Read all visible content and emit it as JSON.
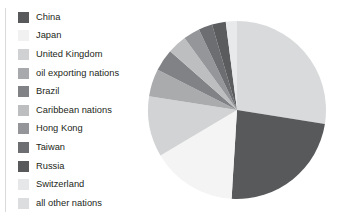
{
  "chart_data": {
    "type": "pie",
    "title": "",
    "legend_position": "left",
    "grid": false,
    "categories": [
      "China",
      "Japan",
      "United Kingdom",
      "oil exporting nations",
      "Brazil",
      "Caribbean nations",
      "Hong Kong",
      "Taiwan",
      "Russia",
      "Switzerland",
      "all other nations"
    ],
    "values": [
      23.5,
      15.5,
      11.0,
      5.0,
      4.0,
      3.5,
      3.0,
      2.5,
      2.5,
      2.0,
      27.5
    ],
    "colors": [
      "#58595b",
      "#f4f4f4",
      "#d2d3d4",
      "#a9abad",
      "#808285",
      "#bcbec0",
      "#949699",
      "#6d6e71",
      "#5b5c5e",
      "#e8e9ea",
      "#d9dadb"
    ]
  },
  "legend": {
    "items": [
      {
        "label": "China",
        "color": "#58595b"
      },
      {
        "label": "Japan",
        "color": "#f1f1f1"
      },
      {
        "label": "United Kingdom",
        "color": "#d0d1d2"
      },
      {
        "label": "oil exporting nations",
        "color": "#a7a9ac"
      },
      {
        "label": "Brazil",
        "color": "#808285"
      },
      {
        "label": "Caribbean nations",
        "color": "#bcbec0"
      },
      {
        "label": "Hong Kong",
        "color": "#939598"
      },
      {
        "label": "Taiwan",
        "color": "#6d6e71"
      },
      {
        "label": "Russia",
        "color": "#58595b"
      },
      {
        "label": "Switzerland",
        "color": "#e6e7e8"
      },
      {
        "label": "all other nations",
        "color": "#dcdddf"
      }
    ]
  },
  "pie": {
    "center_x": 97,
    "center_y": 98,
    "radius": 89,
    "start_angle": 0,
    "slices": [
      {
        "name": "all other nations",
        "sweep": 99.0,
        "color": "#d9dadb"
      },
      {
        "name": "China",
        "sweep": 84.5,
        "color": "#58595b"
      },
      {
        "name": "Japan",
        "sweep": 55.8,
        "color": "#f4f4f4"
      },
      {
        "name": "United Kingdom",
        "sweep": 39.6,
        "color": "#d2d3d4"
      },
      {
        "name": "oil exporting nations",
        "sweep": 18.0,
        "color": "#a9abad"
      },
      {
        "name": "Brazil",
        "sweep": 14.4,
        "color": "#808285"
      },
      {
        "name": "Caribbean nations",
        "sweep": 12.6,
        "color": "#bcbec0"
      },
      {
        "name": "Hong Kong",
        "sweep": 10.8,
        "color": "#949699"
      },
      {
        "name": "Taiwan",
        "sweep": 9.0,
        "color": "#6d6e71"
      },
      {
        "name": "Russia",
        "sweep": 9.0,
        "color": "#5b5c5e"
      },
      {
        "name": "Switzerland",
        "sweep": 7.3,
        "color": "#e8e9ea"
      }
    ]
  }
}
